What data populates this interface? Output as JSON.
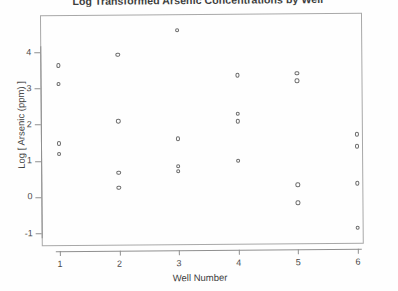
{
  "chart_data": {
    "type": "scatter",
    "title": "Log Transformed Arsenic Concentrations by Well",
    "xlabel": "Well Number",
    "ylabel": "Log [ Arsenic (ppm) ]",
    "grid": false,
    "legend": "none",
    "xlim": [
      0.7,
      6.3
    ],
    "ylim": [
      -1.35,
      4.75
    ],
    "xticks": [
      1,
      2,
      3,
      4,
      5,
      6
    ],
    "xtick_labels": [
      "1",
      "2",
      "3",
      "4",
      "5",
      "6"
    ],
    "yticks": [
      -1,
      0,
      1,
      2,
      3,
      4
    ],
    "ytick_labels": [
      "-1",
      "0",
      "1",
      "2",
      "3",
      "4"
    ],
    "marker": "open-circle",
    "marker_color": "#6b6b6b",
    "groups": [
      {
        "well": 1,
        "values": [
          3.62,
          3.12,
          1.48,
          1.18
        ]
      },
      {
        "well": 2,
        "values": [
          3.92,
          2.08,
          0.66,
          0.24
        ]
      },
      {
        "well": 3,
        "values": [
          4.58,
          1.58,
          0.82,
          0.68
        ]
      },
      {
        "well": 4,
        "values": [
          3.32,
          2.26,
          2.06,
          0.96
        ]
      },
      {
        "well": 5,
        "values": [
          3.36,
          3.16,
          0.28,
          -0.22
        ]
      },
      {
        "well": 6,
        "values": [
          1.66,
          1.34,
          0.32,
          -0.92
        ]
      }
    ],
    "x": [
      1,
      1,
      1,
      1,
      2,
      2,
      2,
      2,
      3,
      3,
      3,
      3,
      4,
      4,
      4,
      4,
      5,
      5,
      5,
      5,
      6,
      6,
      6,
      6
    ],
    "y": [
      3.62,
      3.12,
      1.48,
      1.18,
      3.92,
      2.08,
      0.66,
      0.24,
      4.58,
      1.58,
      0.82,
      0.68,
      3.32,
      2.26,
      2.06,
      0.96,
      3.36,
      3.16,
      0.28,
      -0.22,
      1.66,
      1.34,
      0.32,
      -0.92
    ]
  }
}
